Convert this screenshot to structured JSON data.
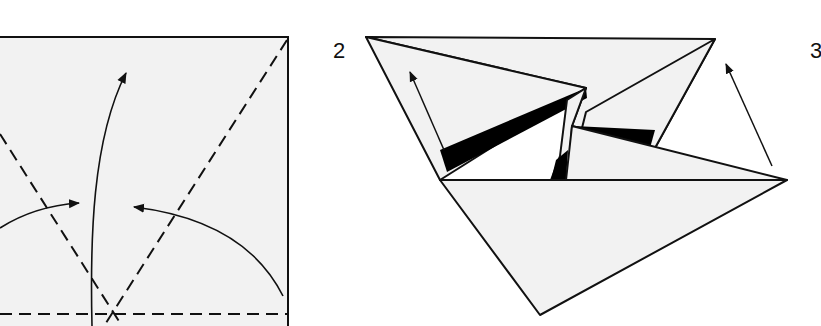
{
  "diagram": {
    "type": "origami-instructions",
    "steps": [
      {
        "number": "",
        "description": "Square with valley-fold creases and fold arrows"
      },
      {
        "number": "2",
        "description": "Partially collapsed paper showing flaps folded inward"
      },
      {
        "number": "3",
        "description": "Next step (cut off at right edge)"
      }
    ],
    "colors": {
      "paper": "#f2f2f2",
      "line": "#111111",
      "shadow": "#000000",
      "background": "#ffffff"
    }
  }
}
